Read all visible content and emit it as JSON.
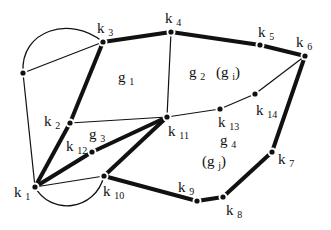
{
  "diagram": {
    "type": "planar-graph",
    "nodes": [
      {
        "id": "k1",
        "label": "k",
        "sub": "1",
        "x": 35,
        "y": 187,
        "lx": 14,
        "ly": 197
      },
      {
        "id": "k2",
        "label": "k",
        "sub": "2",
        "x": 70,
        "y": 123,
        "lx": 44,
        "ly": 126
      },
      {
        "id": "k3",
        "label": "k",
        "sub": "3",
        "x": 103,
        "y": 42,
        "lx": 97,
        "ly": 33
      },
      {
        "id": "k4",
        "label": "k",
        "sub": "4",
        "x": 171,
        "y": 32,
        "lx": 165,
        "ly": 23
      },
      {
        "id": "k5",
        "label": "k",
        "sub": "5",
        "x": 260,
        "y": 45,
        "lx": 258,
        "ly": 37
      },
      {
        "id": "k6",
        "label": "k",
        "sub": "6",
        "x": 305,
        "y": 56,
        "lx": 296,
        "ly": 47
      },
      {
        "id": "k7",
        "label": "k",
        "sub": "7",
        "x": 272,
        "y": 152,
        "lx": 278,
        "ly": 164
      },
      {
        "id": "k8",
        "label": "k",
        "sub": "8",
        "x": 223,
        "y": 197,
        "lx": 226,
        "ly": 215
      },
      {
        "id": "k9",
        "label": "k",
        "sub": "9",
        "x": 197,
        "y": 201,
        "lx": 178,
        "ly": 192
      },
      {
        "id": "k10",
        "label": "k",
        "sub": "10",
        "x": 104,
        "y": 176,
        "lx": 103,
        "ly": 196
      },
      {
        "id": "k11",
        "label": "k",
        "sub": "11",
        "x": 167,
        "y": 117,
        "lx": 168,
        "ly": 136
      },
      {
        "id": "k12",
        "label": "k",
        "sub": "12",
        "x": 92,
        "y": 152,
        "lx": 66,
        "ly": 151
      },
      {
        "id": "k13",
        "label": "k",
        "sub": "13",
        "x": 220,
        "y": 109,
        "lx": 218,
        "ly": 127
      },
      {
        "id": "k14",
        "label": "k",
        "sub": "14",
        "x": 255,
        "y": 94,
        "lx": 256,
        "ly": 115
      },
      {
        "id": "v0",
        "label": "",
        "sub": "",
        "x": 23,
        "y": 73,
        "lx": 0,
        "ly": 0
      }
    ],
    "edges": [
      {
        "from": "k3",
        "to": "k4",
        "thick": true
      },
      {
        "from": "k4",
        "to": "k5",
        "thick": true
      },
      {
        "from": "k5",
        "to": "k6",
        "thick": true
      },
      {
        "from": "k6",
        "to": "k7",
        "thick": true
      },
      {
        "from": "k7",
        "to": "k8",
        "thick": true
      },
      {
        "from": "k8",
        "to": "k9",
        "thick": true
      },
      {
        "from": "k9",
        "to": "k10",
        "thick": true
      },
      {
        "from": "k3",
        "to": "k2",
        "thick": true
      },
      {
        "from": "k2",
        "to": "k1",
        "thick": true
      },
      {
        "from": "k1",
        "to": "k12",
        "thick": true
      },
      {
        "from": "k12",
        "to": "k11",
        "thick": true
      },
      {
        "from": "k10",
        "to": "k11",
        "thick": true
      },
      {
        "from": "k4",
        "to": "k11",
        "thick": false
      },
      {
        "from": "k2",
        "to": "k11",
        "thick": false
      },
      {
        "from": "k11",
        "to": "k13",
        "thick": false
      },
      {
        "from": "k13",
        "to": "k14",
        "thick": false
      },
      {
        "from": "k14",
        "to": "k6",
        "thick": false
      },
      {
        "from": "v0",
        "to": "k3",
        "thick": false
      },
      {
        "from": "v0",
        "to": "k1",
        "thick": false
      },
      {
        "from": "k1",
        "to": "k10",
        "thick": false
      }
    ],
    "curves": [
      {
        "id": "arc-v0-k3",
        "d": "M23,73 C20,30 70,15 103,42"
      },
      {
        "id": "arc-k1-k10",
        "d": "M35,187 C50,215 95,212 104,176"
      }
    ],
    "regions": [
      {
        "id": "g1",
        "label": "g",
        "sub": "1",
        "x": 118,
        "y": 82
      },
      {
        "id": "g2",
        "label": "g",
        "sub": "2",
        "x": 189,
        "y": 77
      },
      {
        "id": "gi",
        "label": "(g",
        "sub": "i",
        "close": ")",
        "x": 216,
        "y": 77
      },
      {
        "id": "g3",
        "label": "g",
        "sub": "3",
        "x": 89,
        "y": 139
      },
      {
        "id": "g4",
        "label": "g",
        "sub": "4",
        "x": 220,
        "y": 145
      },
      {
        "id": "gj",
        "label": "(g",
        "sub": "j",
        "close": ")",
        "x": 202,
        "y": 166
      }
    ]
  }
}
